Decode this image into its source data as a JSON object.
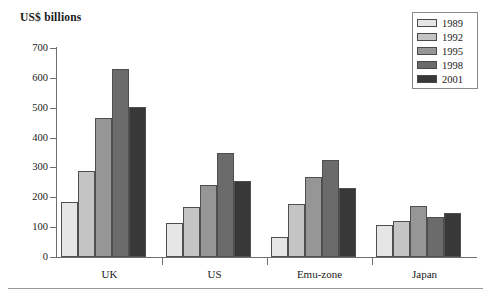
{
  "chart_data": {
    "type": "bar",
    "title": "US$ billions",
    "xlabel": "",
    "ylabel": "",
    "ylim": [
      0,
      700
    ],
    "ytick_step": 100,
    "yticks": [
      0,
      100,
      200,
      300,
      400,
      500,
      600,
      700
    ],
    "grid": false,
    "legend_position": "top-right",
    "categories": [
      "UK",
      "US",
      "Emu-zone",
      "Japan"
    ],
    "series": [
      {
        "name": "1989",
        "color": "#e6e6e6",
        "values": [
          185,
          113,
          67,
          108
        ]
      },
      {
        "name": "1992",
        "color": "#c4c4c4",
        "values": [
          289,
          169,
          178,
          120
        ]
      },
      {
        "name": "1995",
        "color": "#969696",
        "values": [
          465,
          242,
          269,
          170
        ]
      },
      {
        "name": "1998",
        "color": "#6b6b6b",
        "values": [
          629,
          348,
          326,
          133
        ]
      },
      {
        "name": "2001",
        "color": "#383838",
        "values": [
          502,
          253,
          230,
          148
        ]
      }
    ]
  },
  "legend": {
    "items": [
      {
        "label": "1989"
      },
      {
        "label": "1992"
      },
      {
        "label": "1995"
      },
      {
        "label": "1998"
      },
      {
        "label": "2001"
      }
    ]
  },
  "axis": {
    "y_labels": [
      "700",
      "600",
      "500",
      "400",
      "300",
      "200",
      "100",
      "0"
    ]
  },
  "categories_labels": [
    "UK",
    "US",
    "Emu-zone",
    "Japan"
  ],
  "colors": {
    "axis": "#6e6e6e",
    "bar_border": "#4f4f4f",
    "text": "#1a1a1a",
    "rule": "#9a9a9a"
  }
}
